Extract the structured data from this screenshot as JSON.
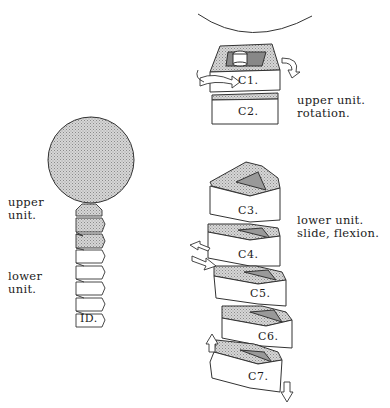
{
  "diagram": {
    "left_figure": {
      "labels": {
        "upper": "upper\nunit.",
        "lower": "lower\nunit."
      },
      "signature": "ID."
    },
    "right_figure": {
      "upper_caption": "upper unit.\nrotation.",
      "lower_caption": "lower unit.\nslide, flexion.",
      "vertebrae": [
        "C1.",
        "C2.",
        "C3.",
        "C4.",
        "C5.",
        "C6.",
        "C7."
      ]
    },
    "colors": {
      "line": "#2a2a2a",
      "stipple": "#b8b8b8",
      "background": "#ffffff"
    }
  }
}
